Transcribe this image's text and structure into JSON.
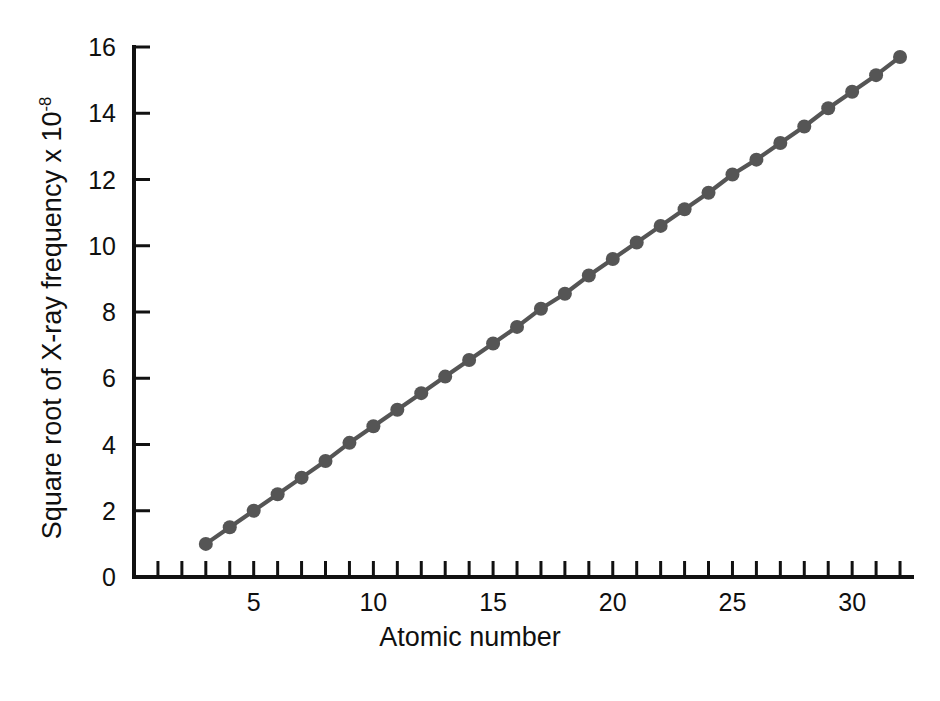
{
  "chart_data": {
    "type": "line",
    "title": "",
    "subtitle": "",
    "xlabel": "Atomic number",
    "ylabel_text": "Square root of X-ray frequency x 10",
    "ylabel_exponent": "-8",
    "ylabel_full": "Square root of X-ray frequency x 10-8",
    "xlim": [
      0,
      32.5
    ],
    "ylim": [
      0,
      16
    ],
    "x_tick_labels": [
      "5",
      "10",
      "15",
      "20",
      "25",
      "30"
    ],
    "x_tick_label_values": [
      5,
      10,
      15,
      20,
      25,
      30
    ],
    "x_minor_ticks": [
      1,
      2,
      3,
      4,
      5,
      6,
      7,
      8,
      9,
      10,
      11,
      12,
      13,
      14,
      15,
      16,
      17,
      18,
      19,
      20,
      21,
      22,
      23,
      24,
      25,
      26,
      27,
      28,
      29,
      30,
      31,
      32
    ],
    "y_tick_labels": [
      "0",
      "2",
      "4",
      "6",
      "8",
      "10",
      "12",
      "14",
      "16"
    ],
    "y_tick_label_values": [
      0,
      2,
      4,
      6,
      8,
      10,
      12,
      14,
      16
    ],
    "grid": false,
    "legend": false,
    "legend_position": "none",
    "series_color": "#555555",
    "axis_color": "#111111",
    "background_color": "#ffffff",
    "marker": "circle",
    "marker_radius": 7,
    "series": [
      {
        "name": "X-ray frequency",
        "x": [
          3,
          4,
          5,
          6,
          7,
          8,
          9,
          10,
          11,
          12,
          13,
          14,
          15,
          16,
          17,
          18,
          19,
          20,
          21,
          22,
          23,
          24,
          25,
          26,
          27,
          28,
          29,
          30,
          31,
          32
        ],
        "values": [
          1.0,
          1.5,
          2.0,
          2.5,
          3.0,
          3.5,
          4.05,
          4.55,
          5.05,
          5.55,
          6.05,
          6.55,
          7.05,
          7.55,
          8.1,
          8.55,
          9.1,
          9.6,
          10.1,
          10.6,
          11.1,
          11.6,
          12.15,
          12.6,
          13.1,
          13.6,
          14.15,
          14.65,
          15.15,
          15.7
        ]
      }
    ]
  }
}
